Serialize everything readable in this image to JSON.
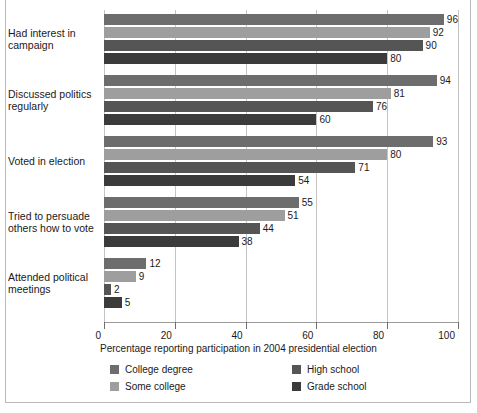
{
  "chart_data": {
    "type": "bar",
    "orientation": "horizontal",
    "title": "",
    "xlabel": "Percentage reporting participation in 2004 presidential election",
    "ylabel": "",
    "xlim": [
      0,
      100
    ],
    "xticks": [
      0,
      20,
      40,
      60,
      80,
      100
    ],
    "grid": "vertical",
    "legend_position": "bottom",
    "categories": [
      "Had interest in campaign",
      "Discussed politics regularly",
      "Voted in election",
      "Tried to persuade others how to vote",
      "Attended political meetings"
    ],
    "series": [
      {
        "name": "College degree",
        "color": "#6d6d6d",
        "values": [
          96,
          94,
          93,
          55,
          12
        ]
      },
      {
        "name": "Some college",
        "color": "#9e9e9e",
        "values": [
          92,
          81,
          80,
          51,
          9
        ]
      },
      {
        "name": "High school",
        "color": "#555555",
        "values": [
          90,
          76,
          71,
          44,
          2
        ]
      },
      {
        "name": "Grade school",
        "color": "#3b3b3b",
        "values": [
          80,
          60,
          54,
          38,
          5
        ]
      }
    ]
  },
  "axis": {
    "tick_labels": [
      "0",
      "20",
      "40",
      "60",
      "80",
      "100"
    ],
    "title": "Percentage reporting participation in 2004 presidential election"
  },
  "categories": [
    {
      "line1": "Had interest in",
      "line2": "campaign"
    },
    {
      "line1": "Discussed politics",
      "line2": "regularly"
    },
    {
      "line1": "Voted in election",
      "line2": ""
    },
    {
      "line1": "Tried to persuade",
      "line2": "others how to vote"
    },
    {
      "line1": "Attended political",
      "line2": "meetings"
    }
  ],
  "legend": {
    "items": [
      {
        "label": "College degree",
        "color": "#6d6d6d"
      },
      {
        "label": "Some college",
        "color": "#9e9e9e"
      },
      {
        "label": "High school",
        "color": "#555555"
      },
      {
        "label": "Grade school",
        "color": "#3b3b3b"
      }
    ]
  },
  "colors": {
    "gridline": "#c4c4c4",
    "axis": "#9a9a9a",
    "frame": "#b9b9b9",
    "text": "#1a1a1a",
    "background": "#ffffff"
  }
}
